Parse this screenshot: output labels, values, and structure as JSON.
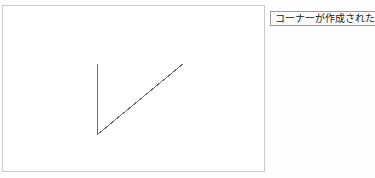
{
  "app": {
    "background_color": "#fefefe"
  },
  "canvas": {
    "name": "drawing-canvas",
    "background_color": "#ffffff",
    "border_color": "#c9c9c9",
    "x": 2,
    "y": 5,
    "width": 263,
    "height": 167,
    "shapes": [
      {
        "name": "corner-polyline",
        "type": "polyline",
        "stroke_color": "#6b6b6b",
        "stroke_width": 1,
        "points": "94,57 94,128 180,57",
        "vertices": [
          {
            "label": "bottom-end",
            "x": 94,
            "y": 128
          },
          {
            "label": "corner-vertex",
            "x": 94,
            "y": 57
          },
          {
            "label": "right-end",
            "x": 180,
            "y": 57
          }
        ]
      }
    ]
  },
  "status_tooltip": {
    "name": "status-tooltip",
    "message": "コーナーが作成された",
    "border_color": "#9a9a9a",
    "background_color": "#fdfdfd",
    "text_color": "#1a1a1a",
    "clipped_right_edge": true
  }
}
